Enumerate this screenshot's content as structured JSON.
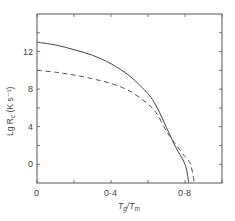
{
  "chart_data": {
    "type": "line",
    "title": "",
    "xlabel": "Tg/Tm",
    "ylabel": "Lg Rc (K s^-1)",
    "xlim": [
      0,
      1.0
    ],
    "ylim": [
      -2,
      16
    ],
    "grid": false,
    "legend": null,
    "x_ticks": [
      0,
      0.2,
      0.4,
      0.6,
      0.8,
      1.0
    ],
    "x_tick_labels": [
      "0",
      "",
      "0·4",
      "",
      "0·8",
      ""
    ],
    "y_ticks": [
      0,
      2,
      4,
      6,
      8,
      10,
      12,
      14
    ],
    "y_tick_labels": [
      "0",
      "",
      "4",
      "",
      "8",
      "",
      "12",
      ""
    ],
    "series": [
      {
        "name": "solid",
        "style": "solid",
        "x": [
          0,
          0.1,
          0.2,
          0.3,
          0.4,
          0.5,
          0.6,
          0.65,
          0.7,
          0.75,
          0.8,
          0.82
        ],
        "y": [
          13.0,
          12.7,
          12.2,
          11.6,
          10.7,
          9.4,
          7.5,
          6.0,
          3.9,
          1.8,
          0.0,
          -1.9
        ]
      },
      {
        "name": "dashed",
        "style": "dashed",
        "x": [
          0,
          0.1,
          0.2,
          0.3,
          0.4,
          0.5,
          0.6,
          0.65,
          0.7,
          0.75,
          0.8,
          0.83,
          0.85
        ],
        "y": [
          10.0,
          9.8,
          9.5,
          9.1,
          8.6,
          7.8,
          6.4,
          5.3,
          3.5,
          2.1,
          0.8,
          0.0,
          -1.9
        ]
      }
    ],
    "annotations": []
  },
  "labels": {
    "x_axis": "T",
    "x_axis_sub1": "g",
    "x_axis_mid": "/T",
    "x_axis_sub2": "m",
    "y_axis": "Lg R",
    "y_axis_sub": "c",
    "y_axis_units": " (K s⁻¹)"
  },
  "colors": {
    "axis": "#555555",
    "solid_line": "#444444",
    "dashed_line": "#555555",
    "text": "#444444"
  }
}
